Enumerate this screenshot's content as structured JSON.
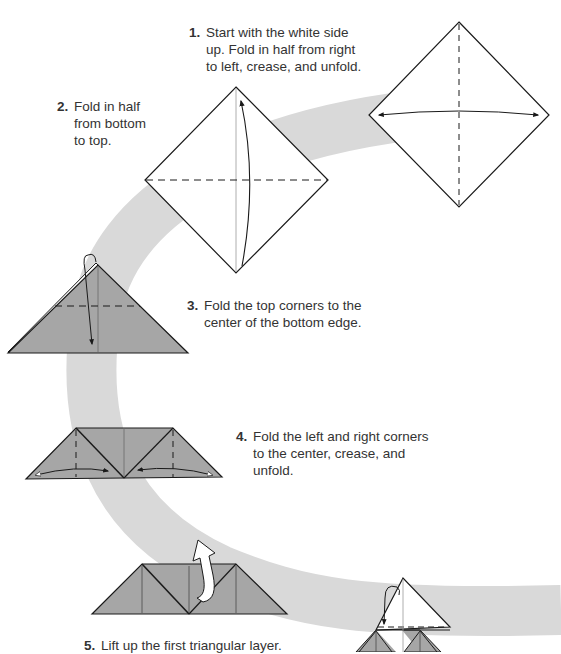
{
  "colors": {
    "band": "#d9d9d9",
    "paper_colored": "#a6a6a6",
    "paper_white": "#ffffff",
    "line": "#1a1a1a",
    "text": "#333333"
  },
  "steps": [
    {
      "number": "1.",
      "text": "Start with the white side up. Fold in half from right to left, crease, and unfold."
    },
    {
      "number": "2.",
      "text": "Fold in half from bottom to top."
    },
    {
      "number": "3.",
      "text": "Fold the top corners to the center of the bottom edge."
    },
    {
      "number": "4.",
      "text": "Fold the left and right corners to the center, crease, and unfold."
    },
    {
      "number": "5.",
      "text": "Lift up the first triangular layer."
    }
  ]
}
